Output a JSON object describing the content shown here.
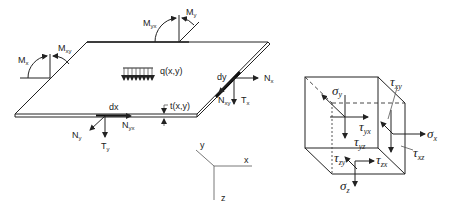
{
  "plate": {
    "moments": {
      "Mx": {
        "base": "M",
        "sub": "x"
      },
      "Mxy": {
        "base": "M",
        "sub": "xy"
      },
      "Myx": {
        "base": "M",
        "sub": "yx"
      },
      "My": {
        "base": "M",
        "sub": "y"
      }
    },
    "load_label": "q(x,y)",
    "thickness_label": "t(x,y)",
    "dx_label": "dx",
    "dy_label": "dy",
    "forces": {
      "Nx": {
        "base": "N",
        "sub": "x"
      },
      "Nxy": {
        "base": "N",
        "sub": "xy"
      },
      "Tx": {
        "base": "T",
        "sub": "x"
      },
      "Ny": {
        "base": "N",
        "sub": "y"
      },
      "Nyx": {
        "base": "N",
        "sub": "yx"
      },
      "Ty": {
        "base": "T",
        "sub": "y"
      }
    }
  },
  "axes": {
    "x": "x",
    "y": "y",
    "z": "z"
  },
  "cube": {
    "sigma_y": {
      "base": "σ",
      "sub": "y"
    },
    "tau_yx": {
      "base": "τ",
      "sub": "yx"
    },
    "tau_yz": {
      "base": "τ",
      "sub": "yz"
    },
    "tau_xy": {
      "base": "τ",
      "sub": "xy"
    },
    "sigma_x": {
      "base": "σ",
      "sub": "x"
    },
    "tau_xz": {
      "base": "τ",
      "sub": "xz"
    },
    "tau_zy": {
      "base": "τ",
      "sub": "zy"
    },
    "tau_zx": {
      "base": "τ",
      "sub": "zx"
    },
    "sigma_z": {
      "base": "σ",
      "sub": "z"
    }
  }
}
